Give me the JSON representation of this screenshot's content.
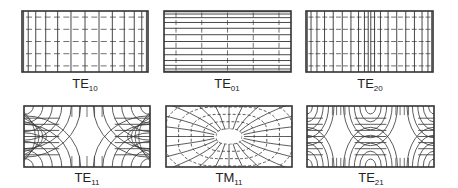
{
  "figure": {
    "stroke_color": "#333333",
    "modes": [
      {
        "id": "TE10",
        "base": "TE",
        "sub": "10",
        "box": [
          22,
          11,
          148,
          72
        ],
        "label_x": 85,
        "label_y": 76
      },
      {
        "id": "TE01",
        "base": "TE",
        "sub": "01",
        "box": [
          164,
          11,
          291,
          72
        ],
        "label_x": 227,
        "label_y": 76
      },
      {
        "id": "TE20",
        "base": "TE",
        "sub": "20",
        "box": [
          306,
          11,
          433,
          72
        ],
        "label_x": 370,
        "label_y": 76
      },
      {
        "id": "TE11",
        "base": "TE",
        "sub": "11",
        "box": [
          24,
          106,
          150,
          167
        ],
        "label_x": 87,
        "label_y": 170
      },
      {
        "id": "TM11",
        "base": "TM",
        "sub": "11",
        "box": [
          166,
          106,
          292,
          167
        ],
        "label_x": 229,
        "label_y": 170
      },
      {
        "id": "TE21",
        "base": "TE",
        "sub": "21",
        "box": [
          307,
          106,
          434,
          167
        ],
        "label_x": 371,
        "label_y": 170
      }
    ]
  }
}
